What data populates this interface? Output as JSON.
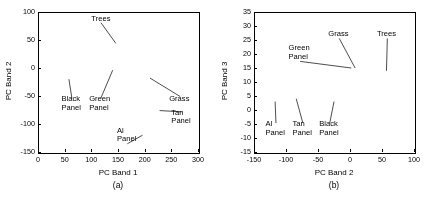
{
  "figure": {
    "background": "#ffffff",
    "point_color": "#000000"
  },
  "chart_data": [
    {
      "type": "scatter",
      "panel": "a",
      "caption": "(a)",
      "title": "",
      "xlabel": "PC Band 1",
      "ylabel": "PC Band 2",
      "xlim": [
        0,
        300
      ],
      "ylim": [
        -150,
        100
      ],
      "xticks": [
        0,
        50,
        100,
        150,
        200,
        250,
        300
      ],
      "yticks": [
        -150,
        -100,
        -50,
        0,
        50,
        100
      ],
      "xticklabels": [
        "0",
        "50",
        "100",
        "150",
        "200",
        "250",
        "300"
      ],
      "yticklabels": [
        "-150",
        "-100",
        "-50",
        "0",
        "50",
        "100"
      ],
      "grid": false,
      "legend": "none",
      "series": [
        {
          "name": "Trees",
          "kind": "cloud",
          "n": 9000,
          "shape": "elongated-band",
          "x_start": 30,
          "y_start": 2,
          "x_end": 268,
          "y_end": 72,
          "thickness": 9,
          "thickness_end": 16,
          "density": 0.95,
          "opacity": 0.5
        },
        {
          "name": "Grass",
          "kind": "cloud",
          "n": 900,
          "shape": "fan-lower",
          "x_start": 60,
          "y_start": -4,
          "x_end": 255,
          "y_end": -55,
          "thickness": 16,
          "thickness_end": 26,
          "density": 0.25,
          "opacity": 0.16
        },
        {
          "name": "Green Panel",
          "kind": "cloud",
          "n": 150,
          "shape": "streak",
          "x_start": 120,
          "y_start": 2,
          "x_end": 150,
          "y_end": -8,
          "thickness": 5,
          "thickness_end": 5,
          "density": 0.3,
          "opacity": 0.22
        },
        {
          "name": "Black Panel",
          "kind": "cloud",
          "n": 90,
          "shape": "streak",
          "x_start": 40,
          "y_start": -2,
          "x_end": 58,
          "y_end": -20,
          "thickness": 4,
          "thickness_end": 4,
          "density": 0.28,
          "opacity": 0.18
        },
        {
          "name": "Tan Panel",
          "kind": "cloud",
          "n": 220,
          "shape": "streak",
          "x_start": 210,
          "y_start": -70,
          "x_end": 238,
          "y_end": -82,
          "thickness": 5,
          "thickness_end": 5,
          "density": 0.45,
          "opacity": 0.3
        },
        {
          "name": "Al Panel",
          "kind": "cloud",
          "n": 260,
          "shape": "streak",
          "x_start": 175,
          "y_start": -108,
          "x_end": 225,
          "y_end": -132,
          "thickness": 6,
          "thickness_end": 6,
          "density": 0.4,
          "opacity": 0.25
        }
      ],
      "annotations": [
        {
          "label": "Trees",
          "tx": 118,
          "ty": 88,
          "px": 146,
          "py": 44,
          "anchor": "middle"
        },
        {
          "label": "Black Panel",
          "tx": 44,
          "ty": -56,
          "px": 58,
          "py": -20,
          "anchor": "start",
          "lines": [
            "Black",
            "Panel"
          ]
        },
        {
          "label": "Green Panel",
          "tx": 96,
          "ty": -56,
          "px": 140,
          "py": -4,
          "anchor": "start",
          "lines": [
            "Green",
            "Panel"
          ]
        },
        {
          "label": "Grass",
          "tx": 246,
          "ty": -56,
          "px": 210,
          "py": -18,
          "anchor": "start"
        },
        {
          "label": "Tan Panel",
          "tx": 250,
          "ty": -80,
          "px": 228,
          "py": -76,
          "anchor": "start",
          "lines": [
            "Tan",
            "Panel"
          ]
        },
        {
          "label": "Al Panel",
          "tx": 148,
          "ty": -112,
          "px": 196,
          "py": -120,
          "anchor": "start",
          "lines": [
            "Al",
            "Panel"
          ]
        }
      ]
    },
    {
      "type": "scatter",
      "panel": "b",
      "caption": "(b)",
      "title": "",
      "xlabel": "PC Band 2",
      "ylabel": "PC Band 3",
      "xlim": [
        -150,
        100
      ],
      "ylim": [
        -15,
        35
      ],
      "xticks": [
        -150,
        -100,
        -50,
        0,
        50,
        100
      ],
      "yticks": [
        -15,
        -10,
        -5,
        0,
        5,
        10,
        15,
        20,
        25,
        30,
        35
      ],
      "xticklabels": [
        "-150",
        "-100",
        "-50",
        "0",
        "50",
        "100"
      ],
      "yticklabels": [
        "-15",
        "-10",
        "-5",
        "0",
        "5",
        "10",
        "15",
        "20",
        "25",
        "30",
        "35"
      ],
      "grid": false,
      "legend": "none",
      "series": [
        {
          "name": "Trees",
          "kind": "blob",
          "n": 9000,
          "cx": 56,
          "cy": 12,
          "rx": 17,
          "ry": 9,
          "density": 0.95,
          "opacity": 0.45
        },
        {
          "name": "Grass",
          "kind": "blob",
          "n": 700,
          "cx": 6,
          "cy": 9,
          "rx": 7,
          "ry": 7,
          "density": 0.3,
          "opacity": 0.16
        },
        {
          "name": "Green Panel",
          "kind": "blob",
          "n": 160,
          "cx": 3,
          "cy": 15,
          "rx": 3,
          "ry": 2,
          "density": 0.3,
          "opacity": 0.25
        },
        {
          "name": "Al Panel",
          "kind": "blob",
          "n": 200,
          "cx": -116,
          "cy": 5,
          "rx": 6,
          "ry": 2,
          "density": 0.4,
          "opacity": 0.3
        },
        {
          "name": "Tan Panel",
          "kind": "blob",
          "n": 180,
          "cx": -84,
          "cy": 5,
          "rx": 5,
          "ry": 2,
          "density": 0.4,
          "opacity": 0.28
        },
        {
          "name": "Black Panel",
          "kind": "blob",
          "n": 120,
          "cx": -24,
          "cy": 4,
          "rx": 4,
          "ry": 2,
          "density": 0.3,
          "opacity": 0.2
        },
        {
          "name": "Scatter bridge",
          "kind": "cloud",
          "n": 500,
          "shape": "streak",
          "x_start": -10,
          "y_start": 6,
          "x_end": 45,
          "y_end": 3,
          "thickness": 5,
          "thickness_end": 7,
          "density": 0.2,
          "opacity": 0.12
        }
      ],
      "annotations": [
        {
          "label": "Green Panel",
          "tx": -96,
          "ty": 22,
          "px": 2,
          "py": 15,
          "anchor": "start",
          "lines": [
            "Green",
            "Panel"
          ]
        },
        {
          "label": "Grass",
          "tx": -34,
          "ty": 27,
          "px": 8,
          "py": 15,
          "anchor": "start"
        },
        {
          "label": "Trees",
          "tx": 42,
          "ty": 27,
          "px": 57,
          "py": 14,
          "anchor": "start"
        },
        {
          "label": "Al Panel",
          "tx": -132,
          "ty": -5,
          "px": -117,
          "py": 3,
          "anchor": "start",
          "lines": [
            "Al",
            "Panel"
          ]
        },
        {
          "label": "Tan Panel",
          "tx": -90,
          "ty": -5,
          "px": -84,
          "py": 4,
          "anchor": "start",
          "lines": [
            "Tan",
            "Panel"
          ]
        },
        {
          "label": "Black Panel",
          "tx": -48,
          "ty": -5,
          "px": -25,
          "py": 3,
          "anchor": "start",
          "lines": [
            "Black",
            "Panel"
          ]
        }
      ]
    }
  ]
}
